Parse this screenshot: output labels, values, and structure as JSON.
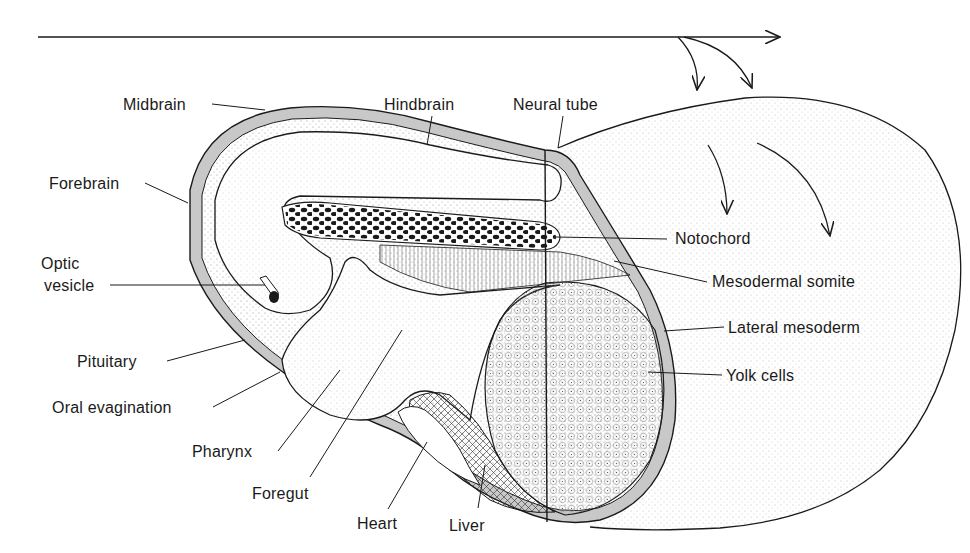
{
  "figure": {
    "colors": {
      "line": "#1a1a1a",
      "layer_gray": "#c8c8c8",
      "stipple": "#6e6e6e",
      "background": "#ffffff"
    }
  },
  "labels": {
    "midbrain": "Midbrain",
    "hindbrain": "Hindbrain",
    "neural_tube": "Neural tube",
    "forebrain": "Forebrain",
    "optic_vesicle_1": "Optic",
    "optic_vesicle_2": "vesicle",
    "notochord": "Notochord",
    "mesodermal_somite": "Mesodermal somite",
    "lateral_mesoderm": "Lateral mesoderm",
    "pituitary": "Pituitary",
    "yolk_cells": "Yolk cells",
    "oral_evagination": "Oral evagination",
    "pharynx": "Pharynx",
    "foregut": "Foregut",
    "heart": "Heart",
    "liver": "Liver"
  }
}
